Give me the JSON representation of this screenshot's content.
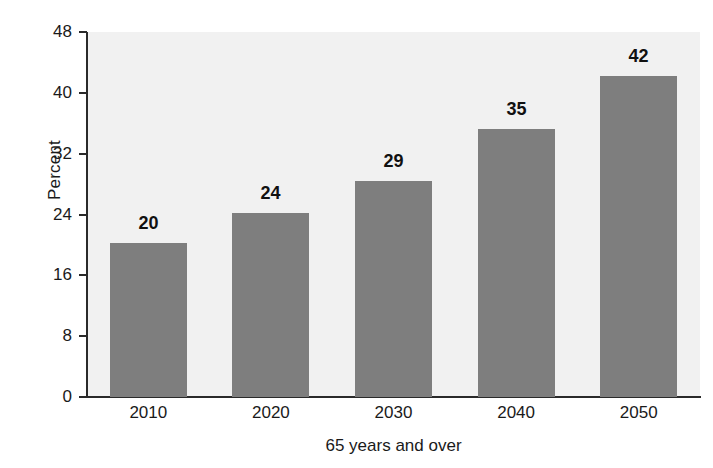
{
  "chart_data": {
    "type": "bar",
    "title": "",
    "subtitle": "",
    "xlabel": "65 years and over",
    "ylabel": "Percent",
    "categories": [
      "2010",
      "2020",
      "2030",
      "2040",
      "2050"
    ],
    "values": [
      20,
      24,
      29,
      35,
      42
    ],
    "bar_tops_measured": [
      20.2,
      24.2,
      28.4,
      35.3,
      42.2
    ],
    "data_labels": [
      "20",
      "24",
      "29",
      "35",
      "42"
    ],
    "ylim": [
      0,
      48
    ],
    "yticks": [
      0,
      8,
      16,
      24,
      32,
      40,
      48
    ],
    "ytick_labels": [
      "0",
      "8",
      "16",
      "24",
      "32",
      "40",
      "48"
    ],
    "grid": false,
    "legend": null,
    "legend_position": "none",
    "series": [
      {
        "name": "Percent 65 years and over",
        "values": [
          20,
          24,
          29,
          35,
          42
        ]
      }
    ],
    "colors": {
      "bar_fill": "#7e7e7e",
      "plot_background": "#f1f1f1",
      "figure_background": "#ffffff",
      "axis_line": "#2a2a2a",
      "text": "#1a1a1a",
      "data_label": "#111111"
    }
  }
}
